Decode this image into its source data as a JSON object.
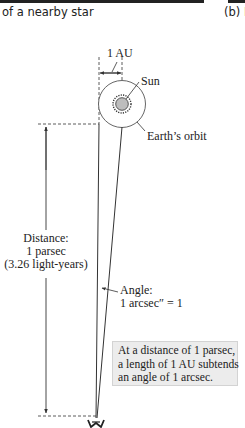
{
  "header": {
    "left_caption": "of a nearby star",
    "right_caption": "(b) P"
  },
  "diagram": {
    "baseline_label": "1 AU",
    "sun_label": "Sun",
    "orbit_label": "Earth’s orbit",
    "distance_label": {
      "line1": "Distance:",
      "line2": "1 parsec",
      "line3": "(3.26 light-years)"
    },
    "angle_label": {
      "line1": "Angle:",
      "line2": "1 arcsec″ = 1"
    },
    "note": {
      "line1": "At a distance of 1 parsec,",
      "line2": "a length of 1 AU subtends",
      "line3": "an angle of 1 arcsec."
    },
    "icons": [
      "sun-icon",
      "orbit-circle",
      "observer-eye-icon"
    ],
    "colors": {
      "line": "#333333",
      "note_fill": "#ececec",
      "note_border": "#d3d3d3",
      "sun_fill": "#bdbdbd"
    }
  }
}
